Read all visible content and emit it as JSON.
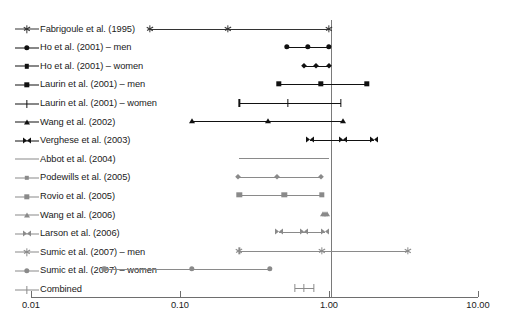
{
  "chart_data": {
    "type": "forest",
    "title": "",
    "xlabel": "",
    "ylabel": "",
    "xscale": "log",
    "xlim": [
      0.01,
      10.0
    ],
    "reference_line": 1.0,
    "tick_values": [
      0.01,
      0.1,
      1.0,
      10.0
    ],
    "tick_labels": [
      "0.01",
      "0.10",
      "1.00",
      "10.00"
    ],
    "grid": false,
    "legend_position": "left",
    "series": [
      {
        "name": "Fabrigoule et al. (1995)",
        "marker": "star",
        "color": "#333333",
        "estimate": 0.21,
        "ci_low": 0.063,
        "ci_high": 1.0
      },
      {
        "name": "Ho et al. (2001) – men",
        "marker": "circle",
        "color": "#111111",
        "estimate": 0.72,
        "ci_low": 0.52,
        "ci_high": 1.0
      },
      {
        "name": "Ho et al. (2001) – women",
        "marker": "diamond",
        "color": "#111111",
        "estimate": 0.82,
        "ci_low": 0.68,
        "ci_high": 1.0
      },
      {
        "name": "Laurin et al. (2001) – men",
        "marker": "square",
        "color": "#111111",
        "estimate": 0.88,
        "ci_low": 0.46,
        "ci_high": 1.8
      },
      {
        "name": "Laurin et al. (2001) – women",
        "marker": "plus",
        "color": "#111111",
        "estimate": 0.53,
        "ci_low": 0.25,
        "ci_high": 1.2
      },
      {
        "name": "Wang et al. (2002)",
        "marker": "triangle",
        "color": "#111111",
        "estimate": 0.39,
        "ci_low": 0.12,
        "ci_high": 1.25
      },
      {
        "name": "Verghese et al. (2003)",
        "marker": "bowtie",
        "color": "#111111",
        "estimate": 1.25,
        "ci_low": 0.74,
        "ci_high": 2.0
      },
      {
        "name": "Abbot et al. (2004)",
        "marker": "none",
        "color": "#8a8a8a",
        "estimate": null,
        "ci_low": 0.25,
        "ci_high": 1.0
      },
      {
        "name": "Podewills et al. (2005)",
        "marker": "diamond",
        "color": "#8a8a8a",
        "estimate": 0.45,
        "ci_low": 0.245,
        "ci_high": 0.89
      },
      {
        "name": "Rovio et al. (2005)",
        "marker": "square",
        "color": "#8a8a8a",
        "estimate": 0.5,
        "ci_low": 0.25,
        "ci_high": 0.895
      },
      {
        "name": "Wang et al. (2006)",
        "marker": "triangle",
        "color": "#8a8a8a",
        "estimate": 0.94,
        "ci_low": 0.91,
        "ci_high": 0.97
      },
      {
        "name": "Larson et al. (2006)",
        "marker": "bowtie",
        "color": "#8a8a8a",
        "estimate": 0.68,
        "ci_low": 0.46,
        "ci_high": 0.94
      },
      {
        "name": "Sumic et al. (2007) – men",
        "marker": "star",
        "color": "#8a8a8a",
        "estimate": 0.9,
        "ci_low": 0.25,
        "ci_high": 3.4
      },
      {
        "name": "Sumic et al. (2007) – women",
        "marker": "circle",
        "color": "#8a8a8a",
        "estimate": 0.12,
        "ci_low": 0.031,
        "ci_high": 0.4
      },
      {
        "name": "Combined",
        "marker": "plus",
        "color": "#8a8a8a",
        "estimate": 0.68,
        "ci_low": 0.59,
        "ci_high": 0.79
      }
    ]
  },
  "legend": {
    "items": [
      {
        "label": "Fabrigoule et al. (1995)"
      },
      {
        "label": "Ho et al. (2001) – men"
      },
      {
        "label": "Ho et al. (2001) – women"
      },
      {
        "label": "Laurin et al. (2001) – men"
      },
      {
        "label": "Laurin et al. (2001) – women"
      },
      {
        "label": "Wang et al. (2002)"
      },
      {
        "label": "Verghese et al. (2003)"
      },
      {
        "label": "Abbot et al. (2004)"
      },
      {
        "label": "Podewills et al. (2005)"
      },
      {
        "label": "Rovio et al. (2005)"
      },
      {
        "label": "Wang et al. (2006)"
      },
      {
        "label": "Larson et al. (2006)"
      },
      {
        "label": "Sumic et al. (2007) – men"
      },
      {
        "label": "Sumic et al. (2007) – women"
      },
      {
        "label": "Combined"
      }
    ]
  },
  "axis": {
    "tick_labels": [
      "0.01",
      "0.10",
      "1.00",
      "10.00"
    ]
  },
  "geometry": {
    "x_at_0_01": 31,
    "x_at_10_00": 478,
    "decade_px": 149,
    "first_row_y": 28.5,
    "row_step": 18.5
  }
}
